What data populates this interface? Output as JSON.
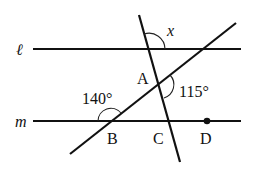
{
  "diagram": {
    "type": "parallel-lines-angles",
    "lines": {
      "l": {
        "label": "ℓ"
      },
      "m": {
        "label": "m"
      }
    },
    "points": {
      "A": {
        "label": "A"
      },
      "B": {
        "label": "B"
      },
      "C": {
        "label": "C"
      },
      "D": {
        "label": "D"
      }
    },
    "angles": {
      "x": {
        "label": "x"
      },
      "angle_at_B": {
        "label": "140°",
        "value_deg": 140
      },
      "angle_at_A": {
        "label": "115°",
        "value_deg": 115
      }
    },
    "colors": {
      "ink": "#111111",
      "background": "#ffffff"
    }
  }
}
